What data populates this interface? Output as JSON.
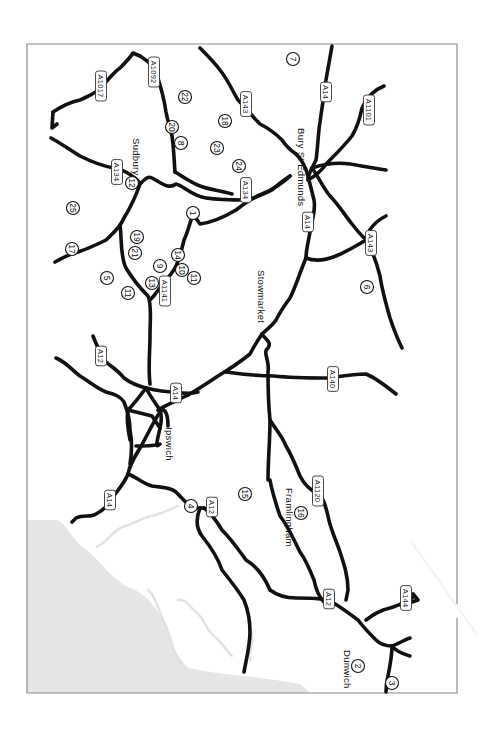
{
  "map": {
    "orientation": "rotated 90 degrees clockwise",
    "colors": {
      "road": "#111111",
      "sea": "#e6e6e6",
      "river": "#e2e2e2",
      "frame": "#8a8a8a",
      "background": "#ffffff"
    },
    "towns": [
      {
        "name": "Sudbury",
        "x": 133,
        "y": 138
      },
      {
        "name": "Bury St Edmunds",
        "x": 298,
        "y": 128
      },
      {
        "name": "Stowmarket",
        "x": 258,
        "y": 270
      },
      {
        "name": "Ipswich",
        "x": 166,
        "y": 427
      },
      {
        "name": "Framlingham",
        "x": 286,
        "y": 488
      },
      {
        "name": "Dunwich",
        "x": 344,
        "y": 650
      }
    ],
    "road_labels": [
      {
        "label": "A1017",
        "x": 101,
        "y": 86
      },
      {
        "label": "A1092",
        "x": 154,
        "y": 72
      },
      {
        "label": "A143",
        "x": 246,
        "y": 104
      },
      {
        "label": "A14",
        "x": 326,
        "y": 92
      },
      {
        "label": "A1101",
        "x": 369,
        "y": 110
      },
      {
        "label": "A134",
        "x": 117,
        "y": 172
      },
      {
        "label": "A134",
        "x": 246,
        "y": 190
      },
      {
        "label": "A14",
        "x": 308,
        "y": 222
      },
      {
        "label": "A143",
        "x": 371,
        "y": 243
      },
      {
        "label": "A1141",
        "x": 165,
        "y": 291
      },
      {
        "label": "A12",
        "x": 101,
        "y": 356
      },
      {
        "label": "A14",
        "x": 176,
        "y": 393
      },
      {
        "label": "A140",
        "x": 333,
        "y": 379
      },
      {
        "label": "A14",
        "x": 110,
        "y": 500
      },
      {
        "label": "A12",
        "x": 212,
        "y": 507
      },
      {
        "label": "A1120",
        "x": 318,
        "y": 491
      },
      {
        "label": "A12",
        "x": 329,
        "y": 599
      },
      {
        "label": "A144",
        "x": 406,
        "y": 598
      }
    ],
    "markers": [
      {
        "n": "1",
        "x": 193,
        "y": 213
      },
      {
        "n": "2",
        "x": 358,
        "y": 666
      },
      {
        "n": "3",
        "x": 392,
        "y": 683
      },
      {
        "n": "4",
        "x": 191,
        "y": 506
      },
      {
        "n": "5",
        "x": 107,
        "y": 278
      },
      {
        "n": "6",
        "x": 367,
        "y": 287
      },
      {
        "n": "7",
        "x": 293,
        "y": 59
      },
      {
        "n": "8",
        "x": 181,
        "y": 143
      },
      {
        "n": "9",
        "x": 160,
        "y": 266
      },
      {
        "n": "10",
        "x": 182,
        "y": 270
      },
      {
        "n": "11",
        "x": 194,
        "y": 278
      },
      {
        "n": "11",
        "x": 128,
        "y": 293
      },
      {
        "n": "12",
        "x": 132,
        "y": 183
      },
      {
        "n": "13",
        "x": 152,
        "y": 283
      },
      {
        "n": "14",
        "x": 178,
        "y": 255
      },
      {
        "n": "15",
        "x": 245,
        "y": 494
      },
      {
        "n": "16",
        "x": 301,
        "y": 513
      },
      {
        "n": "17",
        "x": 72,
        "y": 249
      },
      {
        "n": "18",
        "x": 225,
        "y": 121
      },
      {
        "n": "19",
        "x": 137,
        "y": 237
      },
      {
        "n": "20",
        "x": 172,
        "y": 127
      },
      {
        "n": "21",
        "x": 135,
        "y": 253
      },
      {
        "n": "22",
        "x": 185,
        "y": 97
      },
      {
        "n": "23",
        "x": 217,
        "y": 148
      },
      {
        "n": "24",
        "x": 239,
        "y": 166
      },
      {
        "n": "25",
        "x": 73,
        "y": 208
      }
    ]
  }
}
